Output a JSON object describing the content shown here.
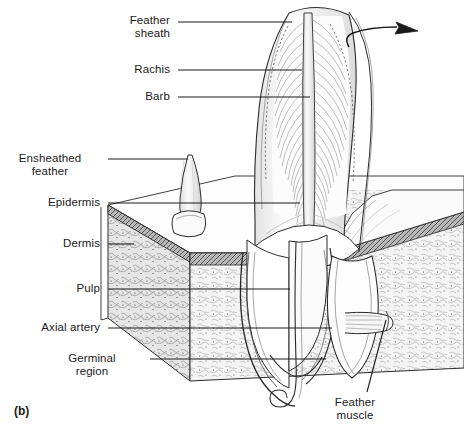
{
  "figure": {
    "panel_label": "(b)",
    "background_color": "#ffffff",
    "ink_color": "#1a1a1a"
  },
  "labels": {
    "feather_sheath": "Feather\nsheath",
    "rachis": "Rachis",
    "barb": "Barb",
    "ensheathed_feather": "Ensheathed\nfeather",
    "epidermis": "Epidermis",
    "dermis": "Dermis",
    "pulp": "Pulp",
    "axial_artery": "Axial artery",
    "germinal_region": "Germinal\nregion",
    "feather_muscle": "Feather\nmuscle"
  },
  "label_positions": {
    "feather_sheath": {
      "x": 170,
      "y": 14,
      "align": "right"
    },
    "rachis": {
      "x": 170,
      "y": 63,
      "align": "right"
    },
    "barb": {
      "x": 170,
      "y": 90,
      "align": "right"
    },
    "ensheathed_feather": {
      "x": 100,
      "y": 152,
      "align": "right"
    },
    "epidermis": {
      "x": 100,
      "y": 196,
      "align": "right"
    },
    "dermis": {
      "x": 100,
      "y": 237,
      "align": "right"
    },
    "pulp": {
      "x": 100,
      "y": 282,
      "align": "right"
    },
    "axial_artery": {
      "x": 100,
      "y": 321,
      "align": "right"
    },
    "germinal_region": {
      "x": 100,
      "y": 352,
      "align": "right"
    },
    "feather_muscle": {
      "x": 355,
      "y": 401,
      "align": "center"
    }
  },
  "leader_lines": [
    {
      "name": "feather-sheath-leader",
      "points": "178,22 290,22"
    },
    {
      "name": "rachis-leader",
      "points": "178,70 300,70"
    },
    {
      "name": "barb-leader",
      "points": "178,97 308,97"
    },
    {
      "name": "ensheathed-feather-leader",
      "points": "108,159 188,159"
    },
    {
      "name": "epidermis-leader",
      "points": "108,203 300,203"
    },
    {
      "name": "dermis-leader",
      "points": "108,244 133,244"
    },
    {
      "name": "pulp-leader",
      "points": "108,289 288,289"
    },
    {
      "name": "axial-artery-leader",
      "points": "108,328 330,328"
    },
    {
      "name": "germinal-region-leader",
      "points": "148,359 325,359"
    },
    {
      "name": "feather-muscle-leader",
      "points": "367,392 385,321"
    }
  ],
  "pointer_arrow": {
    "name": "feather-growth-arrow",
    "description": "curved arrow at feather tip pointing up-right",
    "tail": "348,46",
    "head": "417,31"
  },
  "colors": {
    "ink": "#1a1a1a",
    "line": "#2b2b2b",
    "dermis_fill": "#f2f2f2",
    "dermis_stipple": "#6e6e6e",
    "epidermis_fill": "#9a9a9a",
    "feather_fill": "#fbfbfb",
    "shaft_fill": "#ededed",
    "pulp_fill": "#ffffff",
    "block_top_fill": "#fdfdfd"
  }
}
